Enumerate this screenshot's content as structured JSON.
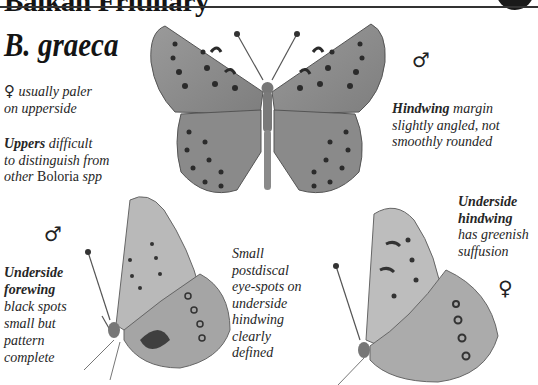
{
  "header": {
    "title": "Balkan Fritillary",
    "badge_icon": "black-circle-tab-icon"
  },
  "species": {
    "name": "B. graeca"
  },
  "notes": {
    "female_paler": {
      "symbol": "♀",
      "line1": "usually paler",
      "line2": "on upperside"
    },
    "uppers": {
      "bold": "Uppers",
      "line1_rest": "difficult",
      "line2": "to distinguish from",
      "line3_italic": "other",
      "line3_roman": "Boloria",
      "line3_end": "spp"
    },
    "hindwing_margin": {
      "bold": "Hindwing",
      "line1_rest": "margin",
      "line2": "slightly angled, not",
      "line3": "smoothly rounded"
    },
    "underside_forewing": {
      "bold1": "Underside",
      "bold2": "forewing",
      "lines": [
        "black spots",
        "small but",
        "pattern",
        "complete"
      ]
    },
    "postdiscal": {
      "lines": [
        "Small",
        "postdiscal",
        "eye-spots on",
        "underside",
        "hindwing",
        "clearly",
        "defined"
      ]
    },
    "underside_hindwing": {
      "bold1": "Underside",
      "bold2": "hindwing",
      "lines": [
        "has greenish",
        "suffusion"
      ]
    }
  },
  "sex_symbols": {
    "male_upper": "♂",
    "male_lower_left": "♂",
    "female_lower_right": "♀"
  },
  "illustrations": {
    "upperside_male": "butterfly-upperside-illustration",
    "underside_male": "butterfly-underside-male-illustration",
    "underside_female": "butterfly-underside-female-illustration"
  },
  "colors": {
    "ink": "#1a1a1a",
    "wing_base": "#8e8e8e",
    "wing_light": "#c9c9c9",
    "spot": "#2a2a2a"
  }
}
